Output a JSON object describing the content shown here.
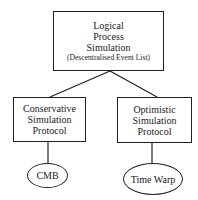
{
  "diagram": {
    "type": "hierarchy",
    "root": {
      "lines": [
        "Logical",
        "Process",
        "Simulation",
        "(Descentralised Event List)"
      ]
    },
    "children": [
      {
        "lines": [
          "Conservative",
          "Simulation",
          "Protocol"
        ],
        "leaf": "CMB"
      },
      {
        "lines": [
          "Optimistic",
          "Simulation",
          "Protocol"
        ],
        "leaf": "Time Warp"
      }
    ],
    "colors": {
      "stroke": "#222222",
      "background": "#ffffff",
      "text": "#1a1a1a"
    }
  }
}
